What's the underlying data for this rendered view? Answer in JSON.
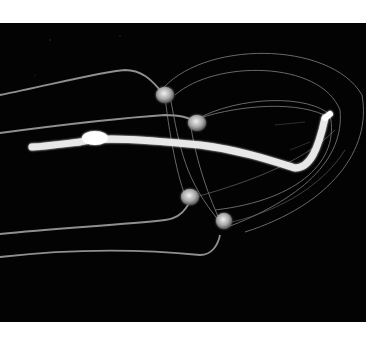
{
  "image": {
    "subject": "Box jellyfish on black background",
    "alt": "Translucent box jellyfish with four trailing tentacles and a bright white manubrium against a black background",
    "colors": {
      "page_background": "#ffffff",
      "photo_background": "#030303",
      "bell": "#9a9a9a",
      "tentacles": "#8f8f8f",
      "manubrium": "#f4f4f4",
      "pedalia": "#d0d0d0"
    },
    "bounds": {
      "x": 0,
      "y": 23,
      "width": 366,
      "height": 299
    }
  }
}
